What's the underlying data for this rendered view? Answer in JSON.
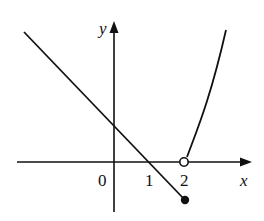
{
  "figure": {
    "type": "piecewise function graph",
    "axis_labels": {
      "x": "x",
      "y": "y"
    },
    "tick_labels": [
      {
        "text": "0",
        "x": 0
      },
      {
        "text": "1",
        "x": 1
      },
      {
        "text": "2",
        "x": 2
      }
    ],
    "pieces": [
      {
        "kind": "line",
        "description": "decreasing line through (0,1) and (1,0), ending at x=2",
        "endpoint": {
          "x": 2,
          "y": -1,
          "style": "closed"
        }
      },
      {
        "kind": "curve",
        "description": "increasing curve starting at (2,0)",
        "startpoint": {
          "x": 2,
          "y": 0,
          "style": "open"
        }
      }
    ],
    "colors": {
      "stroke": "#111111",
      "background": "#ffffff"
    }
  }
}
